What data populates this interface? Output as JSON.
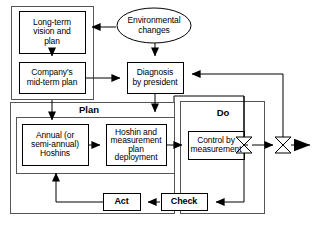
{
  "diagram": {
    "type": "flowchart",
    "title_visible": false,
    "background_color": "#ffffff",
    "stroke_color": "#000000",
    "text_color": "#000000",
    "nodes": [
      {
        "id": "long_term_vision",
        "shape": "rectangle",
        "label": "Long-term\nvision and\nplan",
        "x": 19,
        "y": 11,
        "w": 66,
        "h": 42
      },
      {
        "id": "environmental_changes",
        "shape": "ellipse",
        "label": "Environmental\nchanges",
        "x": 117,
        "y": 8,
        "w": 74,
        "h": 35
      },
      {
        "id": "company_midterm_plan",
        "shape": "rectangle",
        "label": "Company's\nmid-term plan",
        "x": 19,
        "y": 62,
        "w": 66,
        "h": 31
      },
      {
        "id": "diagnosis_by_president",
        "shape": "rectangle",
        "label": "Diagnosis\nby president",
        "x": 127,
        "y": 62,
        "w": 56,
        "h": 31
      },
      {
        "id": "annual_hoshins",
        "shape": "rectangle",
        "label": "Annual (or\nsemi-annual)\nHoshins",
        "x": 22,
        "y": 124,
        "w": 66,
        "h": 41
      },
      {
        "id": "hoshin_deployment",
        "shape": "rectangle",
        "label": "Hoshin and\nmeasurement\nplan\ndeployment",
        "x": 106,
        "y": 124,
        "w": 60,
        "h": 41
      },
      {
        "id": "control_by_measurement",
        "shape": "rectangle",
        "label": "Control by\nmeasurement",
        "x": 188,
        "y": 131,
        "w": 56,
        "h": 28
      },
      {
        "id": "act",
        "shape": "rectangle",
        "label": "Act",
        "x": 103,
        "y": 193,
        "w": 37,
        "h": 17
      },
      {
        "id": "check",
        "shape": "rectangle",
        "label": "Check",
        "x": 161,
        "y": 193,
        "w": 46,
        "h": 17
      }
    ],
    "groups": [
      {
        "id": "left_outer_group",
        "label": "",
        "x": 11,
        "y": 6,
        "w": 82,
        "h": 93
      },
      {
        "id": "plan_group",
        "label": "Plan",
        "label_x": 88,
        "label_y": 105,
        "x": 10,
        "y": 102,
        "w": 164,
        "h": 112
      },
      {
        "id": "plan_inner_group",
        "label": "",
        "x": 16,
        "y": 117,
        "w": 158,
        "h": 57
      },
      {
        "id": "do_group",
        "label": "Do",
        "label_x": 223,
        "label_y": 113,
        "x": 180,
        "y": 101,
        "w": 84,
        "h": 113
      }
    ],
    "valves": [
      {
        "id": "valve_inner",
        "x": 244,
        "y": 145
      },
      {
        "id": "valve_outer",
        "x": 283,
        "y": 145
      }
    ],
    "edges": [
      {
        "id": "env-to-vision",
        "from": "environmental_changes",
        "to": "long_term_vision"
      },
      {
        "id": "env-to-diagnosis",
        "from": "environmental_changes",
        "to": "diagnosis_by_president"
      },
      {
        "id": "vision-to-midterm",
        "from": "long_term_vision",
        "to": "company_midterm_plan"
      },
      {
        "id": "midterm-to-diagnosis",
        "from": "company_midterm_plan",
        "to": "diagnosis_by_president"
      },
      {
        "id": "diagnosis-to-plan",
        "from": "diagnosis_by_president",
        "to": "annual_hoshins"
      },
      {
        "id": "hoshins-to-deployment",
        "from": "annual_hoshins",
        "to": "hoshin_deployment"
      },
      {
        "id": "deployment-to-control",
        "from": "hoshin_deployment",
        "to": "control_by_measurement"
      },
      {
        "id": "control-to-valve",
        "from": "control_by_measurement",
        "to": "valve_inner"
      },
      {
        "id": "valve-to-output",
        "from": "valve_inner",
        "to": "valve_outer"
      },
      {
        "id": "output-arrow",
        "from": "valve_outer",
        "to": "output"
      },
      {
        "id": "valve-to-check",
        "from": "valve_inner",
        "to": "check"
      },
      {
        "id": "check-to-act",
        "from": "check",
        "to": "act"
      },
      {
        "id": "act-to-hoshins",
        "from": "act",
        "to": "annual_hoshins"
      },
      {
        "id": "feedback-to-diagnosis",
        "from": "valve_outer",
        "to": "diagnosis_by_president"
      },
      {
        "id": "feedback-to-plan",
        "from": "valve_inner",
        "to": "plan_group"
      }
    ]
  }
}
